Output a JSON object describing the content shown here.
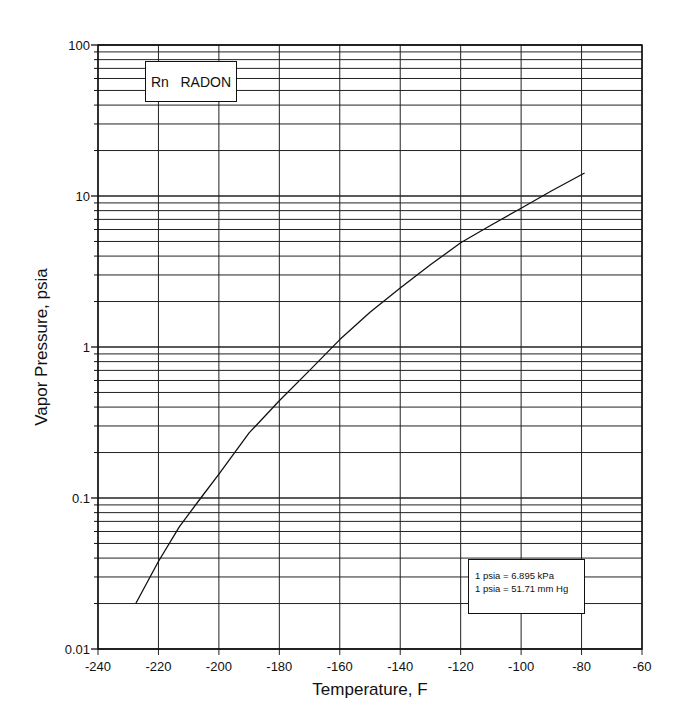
{
  "chart_data": {
    "type": "line",
    "title": "Rn   RADON",
    "xlabel": "Temperature, F",
    "ylabel": "Vapor Pressure, psia",
    "xlim": [
      -240,
      -60
    ],
    "ylim": [
      0.01,
      100
    ],
    "yscale": "log",
    "grid": true,
    "x_ticks": [
      -240,
      -220,
      -200,
      -180,
      -160,
      -140,
      -120,
      -100,
      -80,
      -60
    ],
    "x_tick_labels": [
      "-240",
      "-220",
      "-200",
      "-180",
      "-160",
      "-140",
      "-120",
      "-100",
      "-80",
      "-60"
    ],
    "y_ticks": [
      0.01,
      0.1,
      1,
      10,
      100
    ],
    "y_tick_labels": [
      "0.01",
      "0.1",
      "1",
      "10",
      "100"
    ],
    "series": [
      {
        "name": "Rn RADON",
        "x": [
          -227.5,
          -220,
          -213,
          -206,
          -200,
          -190,
          -180,
          -170,
          -160,
          -150,
          -140,
          -130,
          -120,
          -110,
          -100,
          -90,
          -79
        ],
        "y": [
          0.02,
          0.038,
          0.065,
          0.1,
          0.144,
          0.27,
          0.44,
          0.7,
          1.12,
          1.7,
          2.46,
          3.5,
          4.9,
          6.4,
          8.3,
          10.8,
          14.2
        ]
      }
    ],
    "annotations": [
      "1 psia = 6.895 kPa",
      "1 psia = 51.71 mm Hg"
    ]
  },
  "title_box": {
    "symbol": "Rn",
    "name": "RADON"
  },
  "note_box": {
    "line1": "1 psia = 6.895 kPa",
    "line2": "1 psia = 51.71 mm Hg"
  },
  "colors": {
    "line": "#111111",
    "grid": "#222222",
    "background": "#ffffff"
  }
}
